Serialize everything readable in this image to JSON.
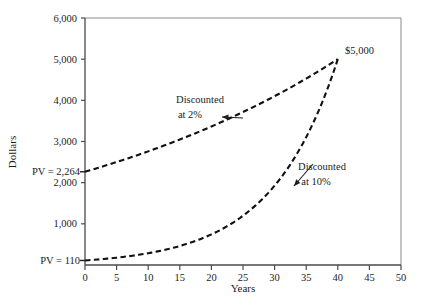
{
  "chart_data": {
    "type": "line",
    "title": "",
    "xlabel": "Years",
    "ylabel": "Dollars",
    "xlim": [
      0,
      50
    ],
    "ylim": [
      0,
      6000
    ],
    "grid": false,
    "legend": "none",
    "x_ticks": [
      0,
      5,
      10,
      15,
      20,
      25,
      30,
      35,
      40,
      45,
      50
    ],
    "x_tick_labels": [
      "0",
      "5",
      "10",
      "15",
      "20",
      "25",
      "30",
      "35",
      "40",
      "45",
      "50"
    ],
    "y_ticks": [
      1000,
      2000,
      3000,
      4000,
      5000,
      6000
    ],
    "y_tick_labels": [
      "1,000",
      "2,000",
      "3,000",
      "4,000",
      "5,000",
      "6,000"
    ],
    "future_value": 5000,
    "endpoint_year": 40,
    "endpoint_label": "$5,000",
    "series": [
      {
        "name": "Discounted at 2%",
        "rate": 0.02,
        "present_value": 2264,
        "pv_label": "PV = 2,264",
        "style": "dashed",
        "x": [
          0,
          5,
          10,
          15,
          20,
          25,
          30,
          35,
          40
        ],
        "values": [
          2264,
          2500,
          2761,
          3049,
          3366,
          3716,
          4103,
          4530,
          5000
        ]
      },
      {
        "name": "Discounted at 10%",
        "rate": 0.1,
        "present_value": 110,
        "pv_label": "PV = 110",
        "style": "dashed",
        "x": [
          0,
          5,
          10,
          15,
          20,
          25,
          30,
          35,
          40
        ],
        "values": [
          110,
          178,
          287,
          462,
          743,
          1197,
          1928,
          3105,
          5000
        ]
      }
    ],
    "annotations": [
      {
        "id": "annot-2pct",
        "line1": "Discounted",
        "line2": "at 2%",
        "text_x": 200,
        "text_y": 103,
        "arrow_from_x": 243,
        "arrow_from_y": 118,
        "arrow_to_x": 222,
        "arrow_to_y": 117
      },
      {
        "id": "annot-10pct",
        "line1": "Discounted",
        "line2": "at 10%",
        "text_x": 312,
        "text_y": 177,
        "arrow_from_x": 313,
        "arrow_from_y": 164,
        "arrow_to_x": 294,
        "arrow_to_y": 186
      }
    ],
    "colors": {
      "curve": "#111111",
      "axis": "#4a4a4a",
      "frame": "#7a7a7a",
      "text": "#1c1c1c",
      "background": "#ffffff"
    }
  }
}
